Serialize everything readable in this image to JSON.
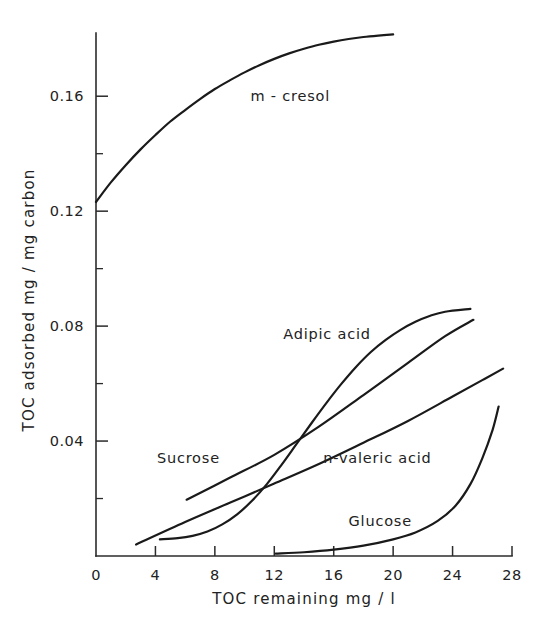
{
  "chart_data": {
    "type": "line",
    "title": "",
    "xlabel": "TOC  remaining   mg / l",
    "ylabel": "TOC  adsorbed        mg / mg carbon",
    "xlim": [
      0,
      28
    ],
    "ylim": [
      0,
      0.182
    ],
    "grid": false,
    "legend_position": "inline-labels",
    "xticks": [
      "0",
      "4",
      "8",
      "12",
      "16",
      "20",
      "24",
      "28"
    ],
    "xtick_values": [
      0,
      4,
      8,
      12,
      16,
      20,
      24,
      28
    ],
    "yticks": [
      "0.04",
      "0.08",
      "0.12",
      "0.16"
    ],
    "ytick_values": [
      0.04,
      0.08,
      0.12,
      0.16
    ],
    "yminor_values": [
      0.02,
      0.06,
      0.1,
      0.14
    ],
    "series": [
      {
        "name": "m-cresol",
        "label": "m - cresol",
        "label_x": 10.4,
        "label_y": 0.1585,
        "points": [
          [
            0.0,
            0.1232
          ],
          [
            1.0,
            0.13
          ],
          [
            2.0,
            0.136
          ],
          [
            3.0,
            0.1415
          ],
          [
            4.0,
            0.1465
          ],
          [
            5.0,
            0.1512
          ],
          [
            6.0,
            0.1552
          ],
          [
            7.0,
            0.159
          ],
          [
            8.0,
            0.1625
          ],
          [
            9.0,
            0.1655
          ],
          [
            10.0,
            0.1683
          ],
          [
            11.0,
            0.1708
          ],
          [
            12.0,
            0.173
          ],
          [
            13.0,
            0.1749
          ],
          [
            14.0,
            0.1765
          ],
          [
            15.0,
            0.1779
          ],
          [
            16.0,
            0.179
          ],
          [
            17.0,
            0.1799
          ],
          [
            18.0,
            0.1806
          ],
          [
            19.0,
            0.1811
          ],
          [
            20.0,
            0.1815
          ]
        ]
      },
      {
        "name": "Adipic acid",
        "label": "Adipic   acid",
        "label_x": 12.6,
        "label_y": 0.0755,
        "points": [
          [
            4.3,
            0.0058
          ],
          [
            5.5,
            0.0062
          ],
          [
            6.5,
            0.007
          ],
          [
            7.5,
            0.0085
          ],
          [
            8.5,
            0.011
          ],
          [
            9.5,
            0.0145
          ],
          [
            10.5,
            0.0192
          ],
          [
            11.5,
            0.025
          ],
          [
            12.5,
            0.0318
          ],
          [
            13.5,
            0.039
          ],
          [
            14.5,
            0.0462
          ],
          [
            15.5,
            0.0532
          ],
          [
            16.5,
            0.0598
          ],
          [
            17.5,
            0.0658
          ],
          [
            18.5,
            0.071
          ],
          [
            19.5,
            0.0752
          ],
          [
            20.5,
            0.0787
          ],
          [
            21.5,
            0.0815
          ],
          [
            22.5,
            0.0836
          ],
          [
            23.5,
            0.085
          ],
          [
            25.2,
            0.086
          ]
        ]
      },
      {
        "name": "Sucrose",
        "label": "Sucrose",
        "label_x": 4.1,
        "label_y": 0.0325,
        "points": [
          [
            6.1,
            0.0196
          ],
          [
            9.0,
            0.0272
          ],
          [
            12.0,
            0.0352
          ],
          [
            15.0,
            0.045
          ],
          [
            18.0,
            0.056
          ],
          [
            21.0,
            0.0672
          ],
          [
            23.5,
            0.0765
          ],
          [
            25.4,
            0.0822
          ]
        ]
      },
      {
        "name": "n-valeric acid",
        "label": "n-valeric  acid",
        "label_x": 15.3,
        "label_y": 0.0322,
        "points": [
          [
            2.7,
            0.004
          ],
          [
            6.0,
            0.0118
          ],
          [
            9.0,
            0.0185
          ],
          [
            12.0,
            0.0252
          ],
          [
            15.0,
            0.032
          ],
          [
            18.0,
            0.0394
          ],
          [
            21.0,
            0.047
          ],
          [
            24.0,
            0.0555
          ],
          [
            26.0,
            0.0612
          ],
          [
            27.4,
            0.0652
          ]
        ]
      },
      {
        "name": "Glucose",
        "label": "Glucose",
        "label_x": 17.0,
        "label_y": 0.0105,
        "points": [
          [
            12.1,
            0.0008
          ],
          [
            14.0,
            0.0013
          ],
          [
            16.0,
            0.0022
          ],
          [
            18.0,
            0.0036
          ],
          [
            20.0,
            0.0058
          ],
          [
            21.5,
            0.0082
          ],
          [
            23.0,
            0.0122
          ],
          [
            24.2,
            0.0175
          ],
          [
            25.2,
            0.025
          ],
          [
            26.0,
            0.034
          ],
          [
            26.7,
            0.044
          ],
          [
            27.1,
            0.052
          ]
        ]
      }
    ]
  }
}
